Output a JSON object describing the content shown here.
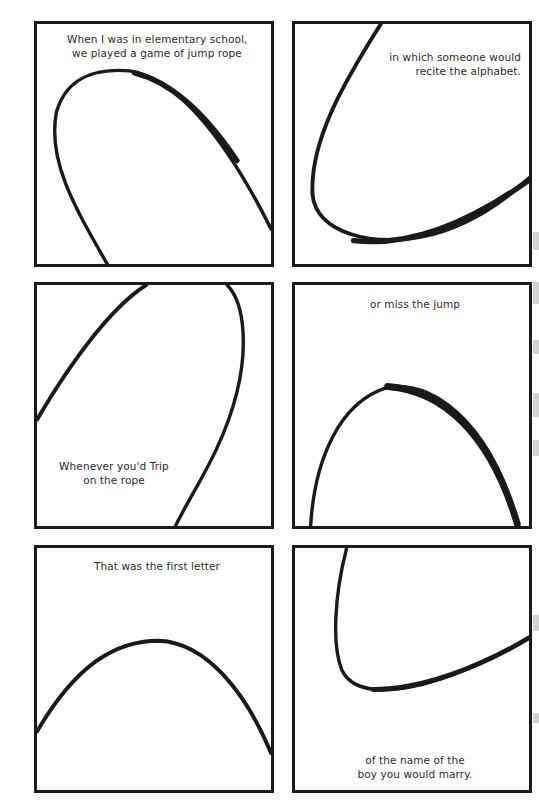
{
  "page": {
    "background": "#ffffff",
    "ink_color": "#1a1a1a"
  },
  "panels": [
    {
      "id": 1,
      "caption": [
        "When I was in elementary school,",
        "we played a game of jump rope"
      ],
      "caption_position": "top-center"
    },
    {
      "id": 2,
      "caption": [
        "in which someone would",
        "recite the alphabet."
      ],
      "caption_position": "top-right"
    },
    {
      "id": 3,
      "caption": [
        "Whenever you'd Trip",
        "on the rope"
      ],
      "caption_position": "bottom-left"
    },
    {
      "id": 4,
      "caption": [
        "or miss the jump"
      ],
      "caption_position": "top-center"
    },
    {
      "id": 5,
      "caption": [
        "That was the first letter"
      ],
      "caption_position": "top-center"
    },
    {
      "id": 6,
      "caption": [
        "of the name of the",
        "boy you would marry."
      ],
      "caption_position": "bottom-center"
    }
  ]
}
